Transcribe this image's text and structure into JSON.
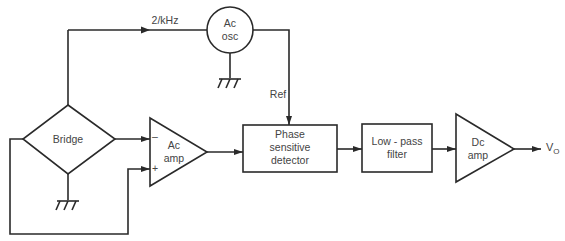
{
  "diagram": {
    "blocks": {
      "oscillator": {
        "line1": "Ac",
        "line2": "osc"
      },
      "bridge": {
        "label": "Bridge"
      },
      "ac_amp": {
        "line1": "Ac",
        "line2": "amp",
        "minus": "–",
        "plus": "+"
      },
      "psd": {
        "line1": "Phase",
        "line2": "sensitive",
        "line3": "detector"
      },
      "lpf": {
        "line1": "Low - pass",
        "line2": "filter"
      },
      "dc_amp": {
        "line1": "Dc",
        "line2": "amp"
      }
    },
    "signals": {
      "excitation": "2/kHz",
      "reference": "Ref",
      "output": "V",
      "output_sub": "O"
    },
    "colors": {
      "line": "#2a2a2a",
      "text": "#444444",
      "background": "#ffffff"
    }
  }
}
